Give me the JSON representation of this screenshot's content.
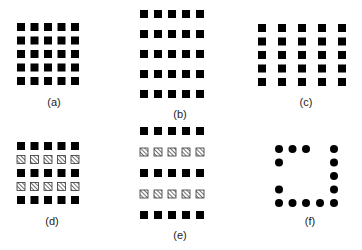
{
  "colors": {
    "fill": "#000000",
    "hatch_bg": "#ffffff",
    "hatch_stroke": "#333333",
    "label": "#222222"
  },
  "square_size": 8,
  "dot_radius": 4,
  "panels": [
    {
      "id": "a",
      "label": "(a)",
      "label_pos": [
        54,
        103
      ],
      "shape": "square",
      "x": [
        21,
        34.5,
        48,
        61.5,
        75
      ],
      "y": [
        27,
        40.5,
        54,
        67.5,
        81
      ],
      "row_styles": [
        "solid",
        "solid",
        "solid",
        "solid",
        "solid"
      ]
    },
    {
      "id": "b",
      "label": "(b)",
      "label_pos": [
        180,
        115
      ],
      "shape": "square",
      "x": [
        144,
        158,
        172,
        186,
        200
      ],
      "y": [
        14,
        34,
        54,
        74,
        94
      ],
      "row_styles": [
        "solid",
        "solid",
        "solid",
        "solid",
        "solid"
      ]
    },
    {
      "id": "c",
      "label": "(c)",
      "label_pos": [
        306,
        103
      ],
      "shape": "square",
      "x": [
        262,
        282,
        302,
        322,
        342
      ],
      "y": [
        28,
        41.5,
        55,
        68.5,
        82
      ],
      "row_styles": [
        "solid",
        "solid",
        "solid",
        "solid",
        "solid"
      ]
    },
    {
      "id": "d",
      "label": "(d)",
      "label_pos": [
        52,
        222
      ],
      "shape": "square",
      "x": [
        21,
        34.5,
        48,
        61.5,
        75
      ],
      "y": [
        146,
        159.5,
        173,
        186.5,
        200
      ],
      "row_styles": [
        "solid",
        "hatched",
        "solid",
        "hatched",
        "solid"
      ]
    },
    {
      "id": "e",
      "label": "(e)",
      "label_pos": [
        180,
        236
      ],
      "shape": "square",
      "x": [
        144,
        158,
        172,
        186,
        200
      ],
      "y": [
        131,
        152,
        173,
        194,
        215
      ],
      "row_styles": [
        "solid",
        "hatched",
        "solid",
        "hatched",
        "solid"
      ]
    },
    {
      "id": "f",
      "label": "(f)",
      "label_pos": [
        310,
        222
      ],
      "shape": "dot",
      "x": [
        279,
        292.5,
        306,
        320,
        334
      ],
      "y": [
        149,
        162.5,
        176,
        189.5,
        203
      ],
      "pattern": [
        [
          1,
          1,
          1,
          0,
          1
        ],
        [
          1,
          0,
          0,
          0,
          1
        ],
        [
          0,
          0,
          0,
          0,
          1
        ],
        [
          1,
          0,
          0,
          0,
          1
        ],
        [
          1,
          1,
          1,
          1,
          1
        ]
      ]
    }
  ]
}
